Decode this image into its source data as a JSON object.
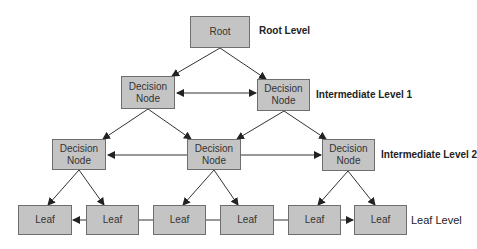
{
  "diagram": {
    "type": "tree",
    "colors": {
      "node_fill": "#c4c4c4",
      "node_border": "#6e6e6e",
      "edge": "#333333",
      "background": "#ffffff"
    },
    "levels": {
      "root": "Root Level",
      "intermediate1": "Intermediate Level 1",
      "intermediate2": "Intermediate Level 2",
      "leaf": "Leaf Level"
    },
    "nodes": {
      "root": "Root",
      "d1_left": "Decision Node",
      "d1_right": "Decision Node",
      "d2_left": "Decision Node",
      "d2_mid": "Decision Node",
      "d2_right": "Decision Node",
      "leaf1": "Leaf",
      "leaf2": "Leaf",
      "leaf3": "Leaf",
      "leaf4": "Leaf",
      "leaf5": "Leaf",
      "leaf6": "Leaf"
    },
    "edges": [
      [
        "root",
        "d1_left"
      ],
      [
        "root",
        "d1_right"
      ],
      [
        "d1_left",
        "d1_right",
        "bidirectional"
      ],
      [
        "d1_left",
        "d2_left"
      ],
      [
        "d1_left",
        "d2_mid"
      ],
      [
        "d1_right",
        "d2_mid"
      ],
      [
        "d1_right",
        "d2_right"
      ],
      [
        "d2_mid",
        "d2_left"
      ],
      [
        "d2_mid",
        "d2_right"
      ],
      [
        "d2_left",
        "leaf1"
      ],
      [
        "d2_left",
        "leaf2"
      ],
      [
        "d2_mid",
        "leaf3"
      ],
      [
        "d2_mid",
        "leaf4"
      ],
      [
        "d2_right",
        "leaf5"
      ],
      [
        "d2_right",
        "leaf6"
      ],
      [
        "leaf2",
        "leaf1"
      ],
      [
        "leaf2",
        "leaf3",
        "line"
      ],
      [
        "leaf3",
        "leaf4",
        "line"
      ],
      [
        "leaf4",
        "leaf5",
        "line"
      ],
      [
        "leaf5",
        "leaf6"
      ]
    ]
  }
}
